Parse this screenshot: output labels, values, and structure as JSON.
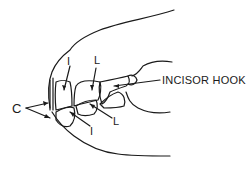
{
  "diagram": {
    "labels": {
      "canine": "C",
      "upper_incisor_central": "I",
      "upper_incisor_lateral": "L",
      "lower_incisor_central": "I",
      "lower_incisor_lateral": "L",
      "hook": "INCISOR HOOK"
    },
    "line_color": "#1a1a1a"
  }
}
